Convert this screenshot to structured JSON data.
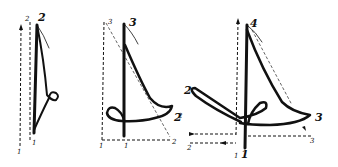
{
  "diagram": {
    "title": "",
    "figures": [
      {
        "id": "figure-1",
        "labels": {
          "top_guide": "2",
          "top_stroke": "2",
          "bottom_guide": "1",
          "bottom_stroke": "1"
        }
      },
      {
        "id": "figure-2",
        "labels": {
          "top_guide": "3",
          "top_stroke": "3",
          "right_stroke": "2",
          "bottom_left": "1",
          "bottom_mid": "1",
          "bottom_right": "2"
        }
      },
      {
        "id": "figure-3",
        "labels": {
          "top_stroke": "4",
          "left_stroke": "2",
          "right_stroke": "3",
          "bottom_stroke": "1",
          "bottom_guide": "1",
          "bottom_left_guide": "2",
          "bottom_right_guide": "3",
          "left_edge": "2"
        }
      }
    ],
    "ink_color": "#111111",
    "background": "#ffffff"
  }
}
